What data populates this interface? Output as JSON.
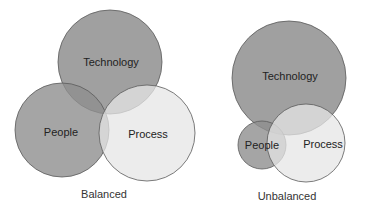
{
  "diagrams": [
    {
      "caption": "Balanced",
      "circles": [
        {
          "label": "Technology",
          "cx": 110,
          "cy": 62,
          "r": 52,
          "fill": "#8f8f8f"
        },
        {
          "label": "People",
          "cx": 62,
          "cy": 130,
          "r": 47,
          "fill": "#8f8f8f"
        },
        {
          "label": "Process",
          "cx": 147,
          "cy": 133,
          "r": 48,
          "fill": "#e6e6e6"
        }
      ]
    },
    {
      "caption": "Unbalanced",
      "circles": [
        {
          "label": "Technology",
          "cx": 289,
          "cy": 78,
          "r": 57,
          "fill": "#8f8f8f"
        },
        {
          "label": "People",
          "cx": 262,
          "cy": 145,
          "r": 24,
          "fill": "#8f8f8f"
        },
        {
          "label": "Process",
          "cx": 306,
          "cy": 143,
          "r": 39,
          "fill": "#e6e6e6"
        }
      ]
    }
  ],
  "colors": {
    "stroke": "#5a5a5a",
    "dark_fill": "#8f8f8f",
    "light_fill": "#e6e6e6"
  }
}
